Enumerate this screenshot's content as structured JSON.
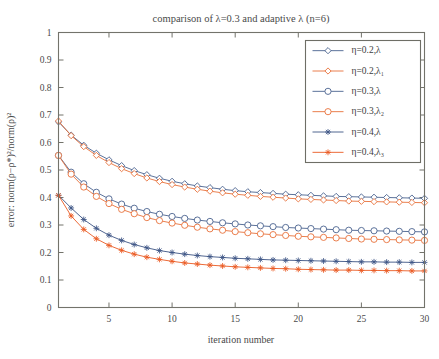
{
  "chart_data": {
    "type": "line",
    "title": "comparison of λ=0.3 and adaptive λ (n=6)",
    "xlabel": "iteration number",
    "ylabel": "error: norm(ρ−ρ*)²/norm(ρ)²",
    "xlim": [
      1,
      30
    ],
    "ylim": [
      0,
      1
    ],
    "xticks": [
      5,
      10,
      15,
      20,
      25,
      30
    ],
    "xtick_labels": [
      "5",
      "10",
      "15",
      "20",
      "25",
      "30"
    ],
    "yticks": [
      0,
      0.1,
      0.2,
      0.3,
      0.4,
      0.5,
      0.6,
      0.7,
      0.8,
      0.9,
      1
    ],
    "ytick_labels": [
      "0",
      "0.1",
      "0.2",
      "0.3",
      "0.4",
      "0.5",
      "0.6",
      "0.7",
      "0.8",
      "0.9",
      "1"
    ],
    "grid": false,
    "legend_position": "top-right",
    "x": [
      1,
      2,
      3,
      4,
      5,
      6,
      7,
      8,
      9,
      10,
      11,
      12,
      13,
      14,
      15,
      16,
      17,
      18,
      19,
      20,
      21,
      22,
      23,
      24,
      25,
      26,
      27,
      28,
      29,
      30
    ],
    "series": [
      {
        "name": "η=0.2,λ",
        "color": "#4a628f",
        "marker": "diamond",
        "values": [
          0.675,
          0.627,
          0.59,
          0.561,
          0.537,
          0.516,
          0.498,
          0.483,
          0.47,
          0.459,
          0.45,
          0.442,
          0.436,
          0.43,
          0.425,
          0.421,
          0.418,
          0.415,
          0.412,
          0.41,
          0.408,
          0.406,
          0.404,
          0.403,
          0.402,
          0.401,
          0.4,
          0.399,
          0.398,
          0.397
        ]
      },
      {
        "name": "η=0.2,λ₁",
        "color": "#e8703a",
        "marker": "diamond",
        "values": [
          0.678,
          0.625,
          0.585,
          0.553,
          0.527,
          0.505,
          0.487,
          0.471,
          0.458,
          0.447,
          0.438,
          0.43,
          0.423,
          0.417,
          0.412,
          0.408,
          0.404,
          0.401,
          0.398,
          0.395,
          0.393,
          0.391,
          0.389,
          0.387,
          0.386,
          0.385,
          0.384,
          0.383,
          0.382,
          0.381
        ]
      },
      {
        "name": "η=0.3,λ",
        "color": "#4a628f",
        "marker": "circle",
        "values": [
          0.553,
          0.492,
          0.45,
          0.419,
          0.395,
          0.376,
          0.361,
          0.349,
          0.339,
          0.331,
          0.324,
          0.318,
          0.313,
          0.308,
          0.304,
          0.3,
          0.297,
          0.294,
          0.291,
          0.289,
          0.287,
          0.285,
          0.283,
          0.281,
          0.28,
          0.279,
          0.278,
          0.277,
          0.276,
          0.275
        ]
      },
      {
        "name": "η=0.3,λ₂",
        "color": "#e8703a",
        "marker": "circle",
        "values": [
          0.553,
          0.485,
          0.438,
          0.404,
          0.378,
          0.357,
          0.341,
          0.327,
          0.316,
          0.307,
          0.299,
          0.292,
          0.286,
          0.281,
          0.276,
          0.272,
          0.268,
          0.265,
          0.262,
          0.259,
          0.257,
          0.255,
          0.253,
          0.251,
          0.249,
          0.248,
          0.247,
          0.246,
          0.245,
          0.244
        ]
      },
      {
        "name": "η=0.4,λ",
        "color": "#3d5585",
        "marker": "star",
        "values": [
          0.408,
          0.362,
          0.32,
          0.288,
          0.263,
          0.244,
          0.229,
          0.217,
          0.207,
          0.2,
          0.194,
          0.189,
          0.185,
          0.182,
          0.179,
          0.177,
          0.175,
          0.173,
          0.172,
          0.171,
          0.17,
          0.169,
          0.168,
          0.167,
          0.166,
          0.166,
          0.165,
          0.165,
          0.164,
          0.164
        ]
      },
      {
        "name": "η=0.4,λ₃",
        "color": "#ea5a22",
        "marker": "star",
        "values": [
          0.408,
          0.333,
          0.284,
          0.25,
          0.226,
          0.208,
          0.194,
          0.183,
          0.175,
          0.168,
          0.162,
          0.158,
          0.154,
          0.151,
          0.148,
          0.146,
          0.144,
          0.142,
          0.141,
          0.139,
          0.138,
          0.137,
          0.136,
          0.136,
          0.135,
          0.135,
          0.134,
          0.134,
          0.133,
          0.133
        ]
      }
    ]
  }
}
